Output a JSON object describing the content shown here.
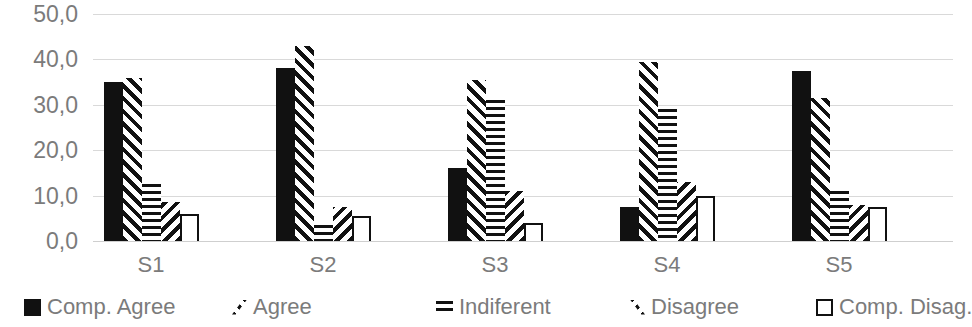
{
  "chart_data": {
    "type": "bar",
    "title": "",
    "subtitle": "",
    "xlabel": "",
    "ylabel": "",
    "ylim": [
      0,
      50
    ],
    "y_ticks": [
      "0,0",
      "10,0",
      "20,0",
      "30,0",
      "40,0",
      "50,0"
    ],
    "y_tick_values": [
      0,
      10,
      20,
      30,
      40,
      50
    ],
    "grid": true,
    "legend_position": "bottom",
    "categories": [
      "S1",
      "S2",
      "S3",
      "S4",
      "S5"
    ],
    "series": [
      {
        "name": "Comp. Agree",
        "pattern": "solid-black",
        "values": [
          35.0,
          38.0,
          16.0,
          7.5,
          37.5
        ]
      },
      {
        "name": "Agree",
        "pattern": "forward-diagonal",
        "values": [
          36.0,
          43.0,
          35.5,
          39.5,
          31.5
        ]
      },
      {
        "name": "Indiferent",
        "pattern": "horizontal-lines",
        "values": [
          12.5,
          3.5,
          31.0,
          29.0,
          11.0
        ]
      },
      {
        "name": "Disagree",
        "pattern": "backward-diagonal",
        "values": [
          8.5,
          7.5,
          11.0,
          13.0,
          8.0
        ]
      },
      {
        "name": "Comp. Disag.",
        "pattern": "white-outline",
        "values": [
          6.0,
          5.5,
          4.0,
          10.0,
          7.5
        ]
      }
    ]
  },
  "axis": {
    "y_ticks": [
      "0,0",
      "10,0",
      "20,0",
      "30,0",
      "40,0",
      "50,0"
    ],
    "x_labels": [
      "S1",
      "S2",
      "S3",
      "S4",
      "S5"
    ]
  },
  "legend": {
    "items": [
      {
        "label": "Comp. Agree",
        "icon": "solid-square-icon"
      },
      {
        "label": "Agree",
        "icon": "forward-diagonal-icon"
      },
      {
        "label": "Indiferent",
        "icon": "horizontal-lines-icon"
      },
      {
        "label": "Disagree",
        "icon": "backward-diagonal-icon"
      },
      {
        "label": "Comp. Disag.",
        "icon": "hollow-square-icon"
      }
    ]
  },
  "colors": {
    "series_fill": "#111111",
    "gridline": "#d9d9d9",
    "tick_text": "#7b7b7b",
    "background": "#ffffff"
  }
}
